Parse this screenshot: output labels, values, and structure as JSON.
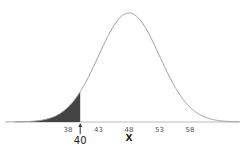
{
  "chart_data": {
    "type": "area",
    "title": "",
    "distribution": "normal",
    "mean": 48,
    "sd": 5,
    "xlabel": "X",
    "ylabel": "",
    "tick_labels": [
      "38",
      "43",
      "48",
      "53",
      "58"
    ],
    "ticks": [
      38,
      43,
      48,
      53,
      58
    ],
    "shaded_region": {
      "from": "-inf",
      "to": 40
    },
    "marker": {
      "value": 40,
      "label": "40"
    },
    "xlim": [
      28,
      66
    ],
    "grid": false,
    "legend": null,
    "colors": {
      "curve": "#9a9a9a",
      "shade": "#444444",
      "axis": "#bbbbbb"
    }
  }
}
